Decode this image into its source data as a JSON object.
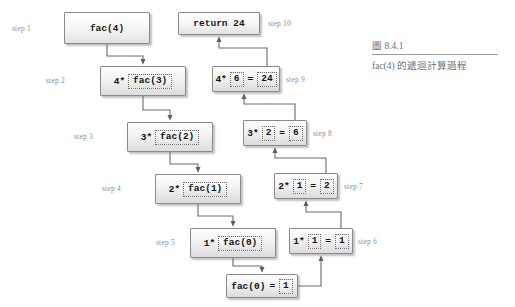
{
  "figure": {
    "number": "圖 8.4.1",
    "caption": "fac(4) 的遞迴計算過程"
  },
  "diagram": {
    "type": "recursion-trace",
    "descend_column_label": "descent (calls)",
    "ascend_column_label": "ascent (returns)",
    "nodes": [
      {
        "id": "step1",
        "step_label": "step 1",
        "text": "fac(4)",
        "prefix": "",
        "inner": "",
        "equals": "",
        "result": "",
        "x": 64,
        "y": 12,
        "w": 86,
        "h": 32,
        "step_x": 12,
        "step_y": 24,
        "style": "plain"
      },
      {
        "id": "step2",
        "step_label": "step 2",
        "text": "",
        "prefix": "4*",
        "inner": "fac(3)",
        "equals": "",
        "result": "",
        "x": 100,
        "y": 66,
        "w": 86,
        "h": 30,
        "step_x": 46,
        "step_y": 76,
        "style": "shaded"
      },
      {
        "id": "step3",
        "step_label": "step 3",
        "text": "",
        "prefix": "3*",
        "inner": "fac(2)",
        "equals": "",
        "result": "",
        "x": 127,
        "y": 122,
        "w": 86,
        "h": 30,
        "step_x": 74,
        "step_y": 132,
        "style": "shaded"
      },
      {
        "id": "step4",
        "step_label": "step 4",
        "text": "",
        "prefix": "2*",
        "inner": "fac(1)",
        "equals": "",
        "result": "",
        "x": 155,
        "y": 174,
        "w": 86,
        "h": 30,
        "step_x": 102,
        "step_y": 184,
        "style": "shaded"
      },
      {
        "id": "step5",
        "step_label": "step 5",
        "text": "",
        "prefix": "1*",
        "inner": "fac(0)",
        "equals": "",
        "result": "",
        "x": 190,
        "y": 228,
        "w": 86,
        "h": 30,
        "step_x": 156,
        "step_y": 238,
        "style": "shaded"
      },
      {
        "id": "base",
        "step_label": "",
        "text": "",
        "prefix": "fac(0)",
        "inner": "",
        "equals": "=",
        "result": "1",
        "x": 226,
        "y": 274,
        "w": 72,
        "h": 24,
        "step_x": 0,
        "step_y": 0,
        "style": "shaded"
      },
      {
        "id": "step6",
        "step_label": "step 6",
        "text": "",
        "prefix": "1*",
        "inner": "1",
        "equals": "=",
        "result": "1",
        "x": 289,
        "y": 228,
        "w": 64,
        "h": 26,
        "step_x": 358,
        "step_y": 237,
        "style": "shaded"
      },
      {
        "id": "step7",
        "step_label": "step 7",
        "text": "",
        "prefix": "2*",
        "inner": "1",
        "equals": "=",
        "result": "2",
        "x": 274,
        "y": 173,
        "w": 64,
        "h": 26,
        "step_x": 344,
        "step_y": 182,
        "style": "shaded"
      },
      {
        "id": "step8",
        "step_label": "step 8",
        "text": "",
        "prefix": "3*",
        "inner": "2",
        "equals": "=",
        "result": "6",
        "x": 243,
        "y": 120,
        "w": 64,
        "h": 26,
        "step_x": 313,
        "step_y": 129,
        "style": "shaded"
      },
      {
        "id": "step9",
        "step_label": "step 9",
        "text": "",
        "prefix": "4*",
        "inner": "6",
        "equals": "=",
        "result": "24",
        "x": 212,
        "y": 66,
        "w": 68,
        "h": 26,
        "step_x": 286,
        "step_y": 75,
        "style": "shaded"
      },
      {
        "id": "step10",
        "step_label": "step 10",
        "text": "return 24",
        "prefix": "",
        "inner": "",
        "equals": "",
        "result": "",
        "x": 178,
        "y": 12,
        "w": 82,
        "h": 23,
        "step_x": 268,
        "step_y": 19,
        "style": "plain"
      }
    ],
    "edges": [
      {
        "id": "e1",
        "from": "step1",
        "to": "step2",
        "label": ""
      },
      {
        "id": "e2",
        "from": "step2",
        "to": "step3",
        "label": ""
      },
      {
        "id": "e3",
        "from": "step3",
        "to": "step4",
        "label": ""
      },
      {
        "id": "e4",
        "from": "step4",
        "to": "step5",
        "label": ""
      },
      {
        "id": "e5",
        "from": "step5",
        "to": "base",
        "label": ""
      },
      {
        "id": "e6",
        "from": "base",
        "to": "step6",
        "label": ""
      },
      {
        "id": "e7",
        "from": "step6",
        "to": "step7",
        "label": ""
      },
      {
        "id": "e8",
        "from": "step7",
        "to": "step8",
        "label": ""
      },
      {
        "id": "e9",
        "from": "step8",
        "to": "step9",
        "label": ""
      },
      {
        "id": "e10",
        "from": "step9",
        "to": "step10",
        "label": ""
      }
    ]
  },
  "colors": {
    "line": "#6b6b6b",
    "box_border": "#8a8a8a",
    "step_text": "#8e8e8e",
    "caption_text": "#6f6f6f",
    "background": "#ffffff"
  }
}
